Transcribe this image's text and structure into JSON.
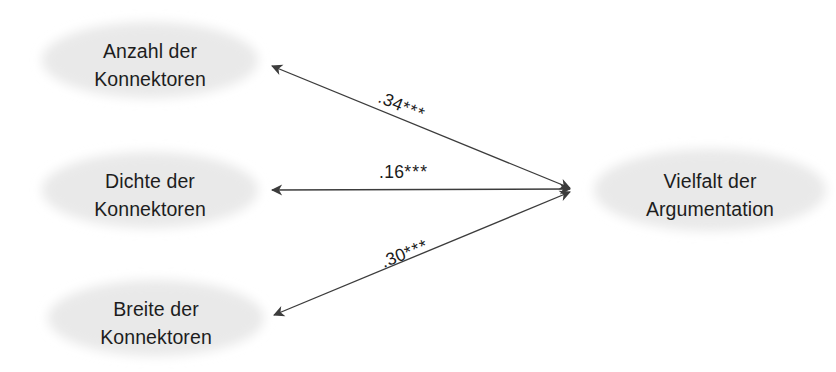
{
  "diagram": {
    "type": "path-model",
    "background_color": "#ffffff",
    "node_fill_color": "#e9e9e9",
    "node_text_color": "#1d1d1d",
    "edge_color": "#3c3c3c",
    "nodes": [
      {
        "id": "anzahl-der-konnektoren",
        "line1": "Anzahl der",
        "line2": "Konnektoren",
        "cx": 150,
        "cy": 60,
        "rx": 112,
        "ry": 42
      },
      {
        "id": "dichte-der-konnektoren",
        "line1": "Dichte der",
        "line2": "Konnektoren",
        "cx": 150,
        "cy": 190,
        "rx": 112,
        "ry": 42
      },
      {
        "id": "breite-der-konnektoren",
        "line1": "Breite der",
        "line2": "Konnektoren",
        "cx": 156,
        "cy": 318,
        "rx": 112,
        "ry": 42
      },
      {
        "id": "vielfalt-der-argumentation",
        "line1": "Vielfalt der",
        "line2": "Argumentation",
        "cx": 710,
        "cy": 190,
        "rx": 120,
        "ry": 45
      }
    ],
    "edges": [
      {
        "id": "edge-anzahl",
        "from": "vielfalt-der-argumentation",
        "to": "anzahl-der-konnektoren",
        "coefficient": ".34",
        "significance": "***",
        "label": ".34***",
        "double_headed": true,
        "x1": 570,
        "y1": 188,
        "x2": 272,
        "y2": 66
      },
      {
        "id": "edge-dichte",
        "from": "vielfalt-der-argumentation",
        "to": "dichte-der-konnektoren",
        "coefficient": ".16",
        "significance": "***",
        "label": ".16***",
        "double_headed": true,
        "x1": 570,
        "y1": 189,
        "x2": 272,
        "y2": 190
      },
      {
        "id": "edge-breite",
        "from": "vielfalt-der-argumentation",
        "to": "breite-der-konnektoren",
        "coefficient": ".30",
        "significance": "***",
        "label": ".30***",
        "double_headed": true,
        "x1": 570,
        "y1": 192,
        "x2": 274,
        "y2": 315
      }
    ]
  }
}
